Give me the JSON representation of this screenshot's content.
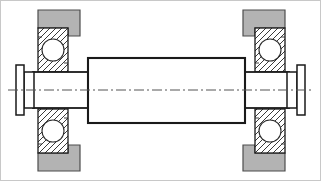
{
  "document": {
    "title": "Shaft and Bearing Assembly Cross-Section",
    "drawing_type": "mechanical-section-view",
    "canvas": {
      "width": 321,
      "height": 181
    },
    "background_color": "#ffffff",
    "border_color": "#c8c8c8"
  },
  "style": {
    "outline_color": "#1a1a1a",
    "thin_line_color": "#2b2b2b",
    "housing_fill": "#b3b3b3",
    "housing_stroke": "#4d4d4d",
    "bearing_race_fill": "#ffffff",
    "bearing_hatch_color": "#3a3a3a",
    "ball_fill": "#ffffff",
    "ball_stroke": "#2b2b2b",
    "part_fill": "#ffffff",
    "centerline_color": "#555555",
    "centerline_dash": "10 3 2 3",
    "heavy_stroke_width": 2,
    "medium_stroke_width": 1.4,
    "thin_stroke_width": 1
  },
  "geometry": {
    "centerline": {
      "y": 90,
      "x_start": 8,
      "x_end": 313
    },
    "roller": {
      "x": 88,
      "y": 58,
      "width": 157,
      "height": 65
    },
    "journal_left": {
      "x": 33,
      "y": 72,
      "width": 55,
      "height": 36
    },
    "journal_right": {
      "x": 245,
      "y": 72,
      "width": 43,
      "height": 36
    },
    "flange_left": {
      "plate": {
        "x": 16,
        "y": 65,
        "width": 8,
        "height": 50
      },
      "collar": {
        "x": 24,
        "y": 72,
        "width": 9,
        "height": 36
      }
    },
    "flange_right": {
      "plate": {
        "x": 296,
        "y": 65,
        "width": 8,
        "height": 50
      },
      "collar": {
        "x": 288,
        "y": 72,
        "width": 8,
        "height": 36
      }
    },
    "bearings": [
      {
        "name": "bearing-left-upper",
        "race": {
          "x": 38,
          "y": 28,
          "width": 30,
          "height": 44
        },
        "ball": {
          "cx": 53,
          "cy": 50,
          "r": 11
        }
      },
      {
        "name": "bearing-left-lower",
        "race": {
          "x": 38,
          "y": 109,
          "width": 30,
          "height": 44
        },
        "ball": {
          "cx": 53,
          "cy": 131,
          "r": 11
        }
      },
      {
        "name": "bearing-right-upper",
        "race": {
          "x": 255,
          "y": 28,
          "width": 30,
          "height": 44
        },
        "ball": {
          "cx": 270,
          "cy": 50,
          "r": 11
        }
      },
      {
        "name": "bearing-right-lower",
        "race": {
          "x": 255,
          "y": 109,
          "width": 30,
          "height": 44
        },
        "ball": {
          "cx": 270,
          "cy": 131,
          "r": 11
        }
      }
    ],
    "housings": [
      {
        "name": "housing-left-upper",
        "points": "38,10 80,10 80,36 68,36 68,28 38,28"
      },
      {
        "name": "housing-left-lower",
        "points": "38,153 68,153 68,145 80,145 80,171 38,171"
      },
      {
        "name": "housing-right-upper",
        "points": "243,10 285,10 285,28 255,28 255,36 243,36"
      },
      {
        "name": "housing-right-lower",
        "points": "243,145 255,145 255,153 285,153 285,171 243,171"
      }
    ]
  },
  "labels": {
    "roller": "roller-drum",
    "shaft_left": "shaft-journal-left",
    "shaft_right": "shaft-journal-right",
    "bearing_left": "ball-bearing-left",
    "bearing_right": "ball-bearing-right",
    "housing": "bearing-housing-block",
    "flange_left": "end-flange-left",
    "flange_right": "end-flange-right",
    "centerline": "axis-centerline"
  },
  "accessible": {
    "summary": "Engineering cross-section drawing of a cylindrical roller shaft supported at each end by a ball bearing seated in a gray housing block, with retaining end flanges at both shaft ends and a horizontal dash-dot axis centerline."
  }
}
